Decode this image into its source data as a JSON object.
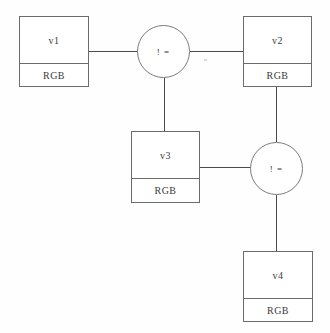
{
  "diagram": {
    "type": "entity-relationship-graph",
    "background_color": "#fefefe",
    "line_color": "#4a4a4a",
    "box_border_color": "#6b6b6b",
    "circle_border_color": "#7a7a7a",
    "text_color": "#3a3a3a",
    "nodes": [
      {
        "id": "v1",
        "label": "v1",
        "attribute": "RGB",
        "x": 19,
        "y": 16,
        "w": 70,
        "h": 71
      },
      {
        "id": "v2",
        "label": "v2",
        "attribute": "RGB",
        "x": 243,
        "y": 16,
        "w": 69,
        "h": 71
      },
      {
        "id": "v3",
        "label": "v3",
        "attribute": "RGB",
        "x": 131,
        "y": 131,
        "w": 69,
        "h": 72
      },
      {
        "id": "v4",
        "label": "v4",
        "attribute": "RGB",
        "x": 243,
        "y": 251,
        "w": 70,
        "h": 71
      }
    ],
    "relations": [
      {
        "id": "rel1",
        "label": "! =",
        "x": 137,
        "y": 25,
        "size": 53
      },
      {
        "id": "rel2",
        "label": "! =",
        "x": 250,
        "y": 142,
        "size": 53
      }
    ],
    "edges": [
      {
        "id": "edge-v1-rel1",
        "from": "v1",
        "to": "rel1",
        "orientation": "horizontal",
        "x": 89,
        "y": 51,
        "length": 49
      },
      {
        "id": "edge-rel1-v2",
        "from": "rel1",
        "to": "v2",
        "orientation": "horizontal",
        "x": 190,
        "y": 51,
        "length": 53
      },
      {
        "id": "edge-rel1-v3",
        "from": "rel1",
        "to": "v3",
        "orientation": "vertical",
        "x": 164,
        "y": 78,
        "length": 53
      },
      {
        "id": "edge-v2-rel2",
        "from": "v2",
        "to": "rel2",
        "orientation": "vertical",
        "x": 276,
        "y": 87,
        "length": 55
      },
      {
        "id": "edge-v3-rel2",
        "from": "v3",
        "to": "rel2",
        "orientation": "horizontal",
        "x": 200,
        "y": 167,
        "length": 51
      },
      {
        "id": "edge-rel2-v4",
        "from": "rel2",
        "to": "v4",
        "orientation": "vertical",
        "x": 276,
        "y": 195,
        "length": 56
      }
    ]
  }
}
